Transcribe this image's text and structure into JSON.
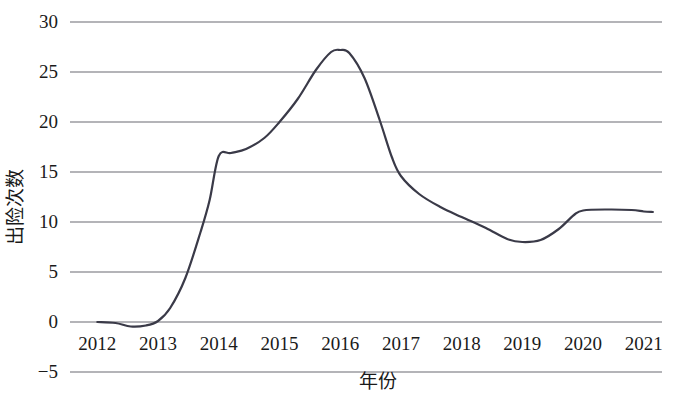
{
  "chart_data": {
    "type": "line",
    "title": "",
    "xlabel": "年份",
    "ylabel": "出险次数",
    "x": [
      2012,
      2013,
      2014,
      2015,
      2016,
      2017,
      2018,
      2019,
      2020,
      2021
    ],
    "xtick_labels": [
      "2012",
      "2013",
      "2014",
      "2015",
      "2016",
      "2017",
      "2018",
      "2019",
      "2020",
      "2021"
    ],
    "ytick_labels": [
      "30",
      "25",
      "20",
      "15",
      "10",
      "5",
      "0",
      "−5"
    ],
    "ytick_values": [
      30,
      25,
      20,
      15,
      10,
      5,
      0,
      -5
    ],
    "xlim": [
      2011.55,
      2021.3
    ],
    "ylim": [
      -5,
      30
    ],
    "grid": "horizontal",
    "legend": "none",
    "series": [
      {
        "name": "出险次数",
        "color": "#3a3a48",
        "values": [
          0.0,
          0.1,
          16.6,
          20.0,
          27.2,
          14.6,
          10.5,
          8.0,
          11.2,
          11.0
        ],
        "points": [
          {
            "x": 2012.0,
            "y": 0.0
          },
          {
            "x": 2012.3,
            "y": -0.1
          },
          {
            "x": 2012.55,
            "y": -0.45
          },
          {
            "x": 2012.8,
            "y": -0.35
          },
          {
            "x": 2013.0,
            "y": 0.1
          },
          {
            "x": 2013.2,
            "y": 1.4
          },
          {
            "x": 2013.45,
            "y": 4.4
          },
          {
            "x": 2013.7,
            "y": 9.0
          },
          {
            "x": 2013.85,
            "y": 12.2
          },
          {
            "x": 2014.0,
            "y": 16.6
          },
          {
            "x": 2014.2,
            "y": 16.9
          },
          {
            "x": 2014.45,
            "y": 17.3
          },
          {
            "x": 2014.75,
            "y": 18.4
          },
          {
            "x": 2015.0,
            "y": 20.0
          },
          {
            "x": 2015.3,
            "y": 22.3
          },
          {
            "x": 2015.6,
            "y": 25.2
          },
          {
            "x": 2015.85,
            "y": 27.0
          },
          {
            "x": 2016.0,
            "y": 27.2
          },
          {
            "x": 2016.15,
            "y": 26.9
          },
          {
            "x": 2016.4,
            "y": 24.4
          },
          {
            "x": 2016.65,
            "y": 20.2
          },
          {
            "x": 2016.85,
            "y": 16.5
          },
          {
            "x": 2017.0,
            "y": 14.6
          },
          {
            "x": 2017.3,
            "y": 12.8
          },
          {
            "x": 2017.65,
            "y": 11.5
          },
          {
            "x": 2018.0,
            "y": 10.5
          },
          {
            "x": 2018.4,
            "y": 9.4
          },
          {
            "x": 2018.75,
            "y": 8.3
          },
          {
            "x": 2019.0,
            "y": 8.0
          },
          {
            "x": 2019.3,
            "y": 8.2
          },
          {
            "x": 2019.6,
            "y": 9.3
          },
          {
            "x": 2019.85,
            "y": 10.7
          },
          {
            "x": 2020.0,
            "y": 11.15
          },
          {
            "x": 2020.4,
            "y": 11.25
          },
          {
            "x": 2020.8,
            "y": 11.2
          },
          {
            "x": 2021.0,
            "y": 11.05
          },
          {
            "x": 2021.15,
            "y": 11.0
          }
        ]
      }
    ],
    "annotations": {
      "peak_year": "2016",
      "peak_value": 27.2,
      "trough_year": "2019",
      "trough_value": 8.0
    }
  }
}
